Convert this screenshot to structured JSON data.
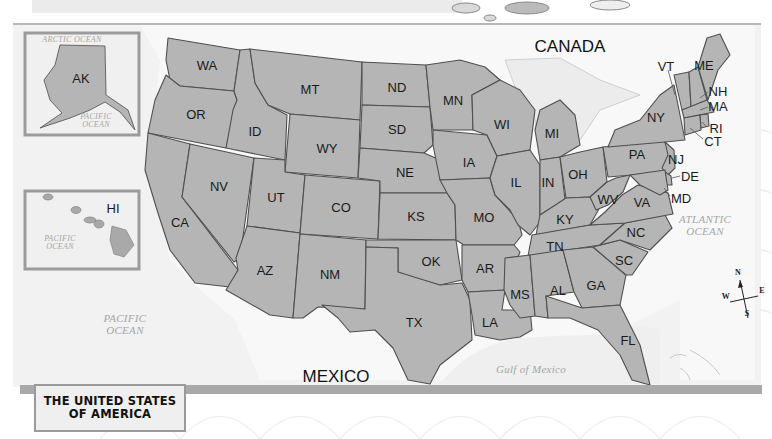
{
  "title": {
    "line1": "THE UNITED STATES",
    "line2": "OF AMERICA"
  },
  "countries": [
    {
      "name": "CANADA",
      "x": 570,
      "y": 46
    },
    {
      "name": "MEXICO",
      "x": 336,
      "y": 376
    }
  ],
  "oceans": [
    {
      "name": "ARCTIC OCEAN",
      "x": 72,
      "y": 40,
      "size": "small"
    },
    {
      "name": "PACIFIC\nOCEAN",
      "x": 96,
      "y": 121,
      "size": "small"
    },
    {
      "name": "PACIFIC\nOCEAN",
      "x": 60,
      "y": 243,
      "size": "small"
    },
    {
      "name": "PACIFIC\nOCEAN",
      "x": 125,
      "y": 325,
      "size": "normal"
    },
    {
      "name": "ATLANTIC\nOCEAN",
      "x": 705,
      "y": 226,
      "size": "normal"
    },
    {
      "name": "Gulf of Mexico",
      "x": 531,
      "y": 370,
      "size": "normal"
    }
  ],
  "states": [
    {
      "abbr": "AK",
      "x": 81,
      "y": 78
    },
    {
      "abbr": "HI",
      "x": 113,
      "y": 208
    },
    {
      "abbr": "WA",
      "x": 207,
      "y": 65
    },
    {
      "abbr": "OR",
      "x": 196,
      "y": 114
    },
    {
      "abbr": "CA",
      "x": 180,
      "y": 222
    },
    {
      "abbr": "ID",
      "x": 255,
      "y": 131
    },
    {
      "abbr": "NV",
      "x": 219,
      "y": 186
    },
    {
      "abbr": "MT",
      "x": 310,
      "y": 89
    },
    {
      "abbr": "WY",
      "x": 327,
      "y": 148
    },
    {
      "abbr": "UT",
      "x": 276,
      "y": 197
    },
    {
      "abbr": "CO",
      "x": 341,
      "y": 207
    },
    {
      "abbr": "AZ",
      "x": 265,
      "y": 270
    },
    {
      "abbr": "NM",
      "x": 330,
      "y": 274
    },
    {
      "abbr": "ND",
      "x": 397,
      "y": 87
    },
    {
      "abbr": "SD",
      "x": 397,
      "y": 129
    },
    {
      "abbr": "NE",
      "x": 405,
      "y": 172
    },
    {
      "abbr": "KS",
      "x": 416,
      "y": 216
    },
    {
      "abbr": "OK",
      "x": 431,
      "y": 261
    },
    {
      "abbr": "TX",
      "x": 414,
      "y": 322
    },
    {
      "abbr": "MN",
      "x": 453,
      "y": 100
    },
    {
      "abbr": "IA",
      "x": 469,
      "y": 162
    },
    {
      "abbr": "MO",
      "x": 484,
      "y": 217
    },
    {
      "abbr": "AR",
      "x": 485,
      "y": 268
    },
    {
      "abbr": "LA",
      "x": 490,
      "y": 322
    },
    {
      "abbr": "WI",
      "x": 502,
      "y": 124
    },
    {
      "abbr": "IL",
      "x": 516,
      "y": 182
    },
    {
      "abbr": "MI",
      "x": 552,
      "y": 133
    },
    {
      "abbr": "IN",
      "x": 548,
      "y": 182
    },
    {
      "abbr": "OH",
      "x": 578,
      "y": 174
    },
    {
      "abbr": "KY",
      "x": 565,
      "y": 219
    },
    {
      "abbr": "TN",
      "x": 555,
      "y": 246
    },
    {
      "abbr": "MS",
      "x": 520,
      "y": 294
    },
    {
      "abbr": "AL",
      "x": 558,
      "y": 290
    },
    {
      "abbr": "GA",
      "x": 596,
      "y": 285
    },
    {
      "abbr": "FL",
      "x": 628,
      "y": 340
    },
    {
      "abbr": "SC",
      "x": 624,
      "y": 260
    },
    {
      "abbr": "NC",
      "x": 636,
      "y": 232
    },
    {
      "abbr": "VA",
      "x": 642,
      "y": 202
    },
    {
      "abbr": "WV",
      "x": 608,
      "y": 199
    },
    {
      "abbr": "PA",
      "x": 637,
      "y": 154
    },
    {
      "abbr": "NY",
      "x": 656,
      "y": 117
    },
    {
      "abbr": "VT",
      "x": 666,
      "y": 66
    },
    {
      "abbr": "ME",
      "x": 704,
      "y": 65
    },
    {
      "abbr": "NH",
      "x": 718,
      "y": 91
    },
    {
      "abbr": "MA",
      "x": 718,
      "y": 106
    },
    {
      "abbr": "RI",
      "x": 716,
      "y": 128
    },
    {
      "abbr": "CT",
      "x": 713,
      "y": 141
    },
    {
      "abbr": "NJ",
      "x": 676,
      "y": 159
    },
    {
      "abbr": "DE",
      "x": 690,
      "y": 176
    },
    {
      "abbr": "MD",
      "x": 681,
      "y": 198
    }
  ],
  "compass": {
    "n": "N",
    "s": "S",
    "e": "E",
    "w": "W"
  },
  "colors": {
    "state_fill": "#b5b5b5",
    "state_border": "#4f4f4f",
    "land_outside": "#f7f7f7",
    "water": "#efefef",
    "frame_bar": "#a9a9a9"
  }
}
